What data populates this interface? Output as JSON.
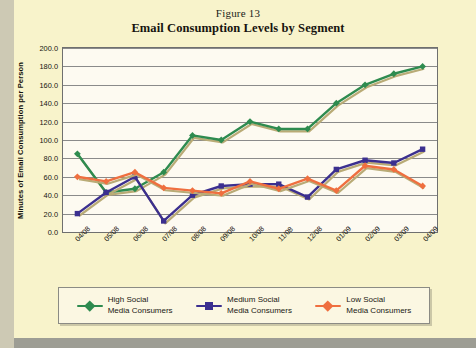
{
  "figure": {
    "label": "Figure 13",
    "title": "Email Consumption Levels by Segment"
  },
  "chart_data": {
    "type": "line",
    "title": "Email Consumption Levels by Segment",
    "subtitle": "Figure 13",
    "xlabel": "",
    "ylabel": "Minutes of Email Consumption per Person",
    "ylim": [
      0,
      200
    ],
    "ytick_step": 20,
    "grid": true,
    "legend_position": "bottom",
    "categories": [
      "04/08",
      "05/08",
      "06/08",
      "07/08",
      "08/08",
      "09/08",
      "10/08",
      "11/08",
      "12/08",
      "01/09",
      "02/09",
      "03/09",
      "04/09"
    ],
    "yticks": [
      "200.0",
      "180.0",
      "160.0",
      "140.0",
      "120.0",
      "100.0",
      "80.0",
      "60.0",
      "40.0",
      "20.0",
      "0.0"
    ],
    "series": [
      {
        "name": "High Social Media Consumers",
        "legend_line1": "High Social",
        "legend_line2": "Media Consumers",
        "color": "#2e8b4f",
        "marker": "diamond",
        "values": [
          85,
          43,
          47,
          65,
          105,
          100,
          120,
          112,
          112,
          140,
          160,
          172,
          180
        ]
      },
      {
        "name": "Medium Social Media Consumers",
        "legend_line1": "Medium Social",
        "legend_line2": "Media Consumers",
        "color": "#3b2f8f",
        "marker": "square",
        "values": [
          20,
          43,
          60,
          12,
          40,
          50,
          52,
          52,
          38,
          68,
          78,
          75,
          90
        ]
      },
      {
        "name": "Low Social Media Consumers",
        "legend_line1": "Low Social",
        "legend_line2": "Media Consumers",
        "color": "#ef6f3f",
        "marker": "diamond",
        "values": [
          60,
          55,
          65,
          48,
          45,
          42,
          55,
          47,
          58,
          45,
          72,
          68,
          50
        ]
      }
    ]
  }
}
